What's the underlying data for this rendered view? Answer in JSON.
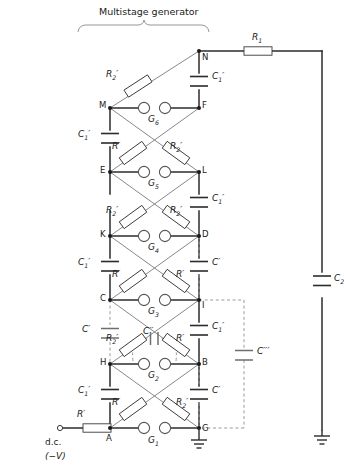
{
  "figure": {
    "title": "Multistage generator",
    "type": "multistage-impulse-generator-circuit"
  },
  "source": {
    "terminal_label": "d.c.",
    "polarity_label": "(−V)"
  },
  "components": {
    "charging_resistor": "R₁",
    "load_capacitor": "C₂",
    "series_resistor_primed": "R′",
    "damping_resistor_primed": "R₂′",
    "stage_capacitor": "C₁′",
    "stray_capacitor": "C′",
    "gap_capacitor": "C″",
    "ground_capacitor": "C‴"
  },
  "nodes": {
    "left_column": [
      "M",
      "E",
      "K",
      "C",
      "H",
      "A"
    ],
    "right_column": [
      "N",
      "F",
      "L",
      "D",
      "I",
      "B",
      "G"
    ]
  },
  "gaps": [
    {
      "name": "G₁",
      "stage": 1
    },
    {
      "name": "G₂",
      "stage": 2
    },
    {
      "name": "G₃",
      "stage": 3
    },
    {
      "name": "G₄",
      "stage": 4
    },
    {
      "name": "G₅",
      "stage": 5
    },
    {
      "name": "G₆",
      "stage": 6
    }
  ],
  "labels": {
    "R1": "R",
    "R1sub": "1",
    "C2": "C",
    "C2sub": "2",
    "Rp": "R",
    "R2p": "R",
    "R2psub": "2",
    "C1p": "C",
    "C1psub": "1",
    "Cp": "C",
    "Cpp": "C",
    "Cppp": "C",
    "G1": "G",
    "G1sub": "1",
    "G2": "G",
    "G2sub": "2",
    "G3": "G",
    "G3sub": "3",
    "G4": "G",
    "G4sub": "4",
    "G5": "G",
    "G5sub": "5",
    "G6": "G",
    "G6sub": "6",
    "N": "N",
    "M": "M",
    "F": "F",
    "E": "E",
    "L": "L",
    "K": "K",
    "D": "D",
    "C": "C",
    "I": "I",
    "H": "H",
    "B": "B",
    "A": "A",
    "G": "G"
  },
  "colors": {
    "line": "#2b2b2b",
    "thin_line": "#6e6e6e",
    "dashed": "#9a9a9a",
    "text": "#1a1a1a",
    "background": "#ffffff"
  }
}
